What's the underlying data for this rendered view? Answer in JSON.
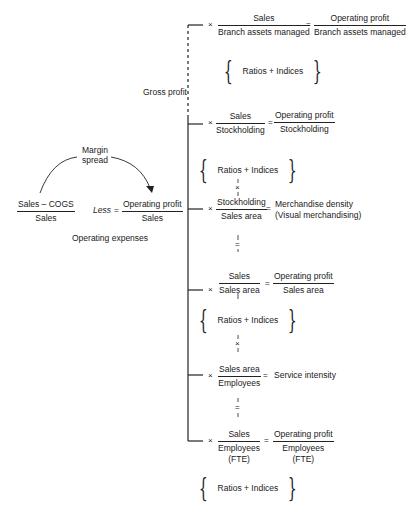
{
  "left": {
    "margin_spread": [
      "Margin",
      "spread"
    ],
    "gross_margin": {
      "num": "Sales – COGS",
      "den": "Sales"
    },
    "less": "Less",
    "equals": "=",
    "operating_margin": {
      "num": "Operating profit",
      "den": "Sales"
    },
    "operating_expenses": "Operating expenses",
    "gross_profit": "Gross profit"
  },
  "branches": [
    {
      "times": "×",
      "ratio": {
        "num": "Sales",
        "den": "Branch assets managed"
      },
      "equals": "=",
      "result": {
        "num": "Operating profit",
        "den": "Branch assets managed"
      }
    },
    {
      "times": "×",
      "ratio": {
        "num": "Sales",
        "den": "Stockholding"
      },
      "equals": "=",
      "result": {
        "num": "Operating profit",
        "den": "Stockholding"
      }
    },
    {
      "times": "×",
      "ratio": {
        "num": "Stockholding",
        "den": "Sales area"
      },
      "equals": "=",
      "result_text": [
        "Merchandise density",
        "(Visual merchandising)"
      ]
    },
    {
      "times": "×",
      "ratio": {
        "num": "Sales",
        "den": "Sales area"
      },
      "equals": "=",
      "result": {
        "num": "Operating profit",
        "den": "Sales area"
      }
    },
    {
      "times": "×",
      "ratio": {
        "num": "Sales area",
        "den": "Employees"
      },
      "equals": "=",
      "result_text": [
        "Service intensity"
      ]
    },
    {
      "times": "×",
      "ratio": {
        "num": "Sales",
        "den": "Employees",
        "den2": "(FTE)"
      },
      "equals": "=",
      "result": {
        "num": "Operating profit",
        "den": "Employees",
        "den2": "(FTE)"
      }
    }
  ],
  "ratios_indices": "Ratios + Indices",
  "connectors": {
    "times": "×",
    "equals": "="
  },
  "colors": {
    "ink": "#1a1a1a",
    "background": "#ffffff"
  }
}
